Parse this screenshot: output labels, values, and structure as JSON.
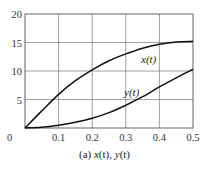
{
  "chart_data": {
    "type": "line",
    "title": "",
    "caption": "(a) x(t), y(t)",
    "xlabel": "",
    "ylabel": "",
    "xlim": [
      0,
      0.5
    ],
    "ylim": [
      0,
      20
    ],
    "x_ticks": [
      "0",
      "0.1",
      "0.2",
      "0.3",
      "0.4",
      "0.5"
    ],
    "y_ticks": [
      "5",
      "10",
      "15",
      "20"
    ],
    "grid": true,
    "legend": "none (inline curve labels)",
    "series": [
      {
        "name": "x(t)",
        "label": "x(t)",
        "x": [
          0,
          0.05,
          0.1,
          0.15,
          0.2,
          0.25,
          0.3,
          0.35,
          0.4,
          0.45,
          0.5
        ],
        "values": [
          0,
          3.0,
          5.9,
          8.3,
          10.2,
          11.8,
          13.0,
          14.0,
          14.7,
          15.1,
          15.2
        ]
      },
      {
        "name": "y(t)",
        "label": "y(t)",
        "x": [
          0,
          0.05,
          0.1,
          0.15,
          0.2,
          0.25,
          0.3,
          0.35,
          0.4,
          0.45,
          0.5
        ],
        "values": [
          0,
          0.15,
          0.5,
          1.0,
          1.7,
          2.7,
          4.0,
          5.5,
          7.2,
          8.8,
          10.3
        ]
      }
    ]
  },
  "labels": {
    "x_curve": "x(t)",
    "y_curve": "y(t)",
    "caption_prefix": "(a) ",
    "caption_x": "x",
    "caption_t1": "(t), ",
    "caption_y": "y",
    "caption_t2": "(t)"
  }
}
